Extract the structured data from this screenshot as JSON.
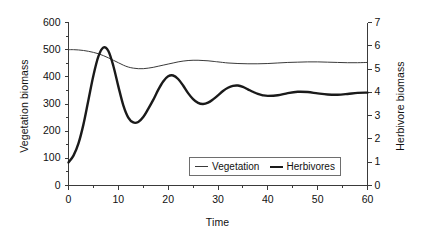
{
  "chart_data": {
    "type": "line",
    "title": "",
    "xlabel": "Time",
    "ylabel": "Vegetation biomass",
    "ylabel_secondary": "Herbivore biomass",
    "xlim": [
      0,
      60
    ],
    "ylim": [
      0,
      600
    ],
    "ylim_secondary": [
      0,
      7
    ],
    "xticks": [
      0,
      10,
      20,
      30,
      40,
      50,
      60
    ],
    "xtick_labels": [
      "0",
      "10",
      "20",
      "30",
      "40",
      "50",
      "60"
    ],
    "yticks": [
      0,
      100,
      200,
      300,
      400,
      500,
      600
    ],
    "ytick_labels": [
      "0",
      "100",
      "200",
      "300",
      "400",
      "500",
      "600"
    ],
    "yticks_secondary": [
      0,
      1,
      2,
      3,
      4,
      5,
      6,
      7
    ],
    "ytick_labels_secondary": [
      "0",
      "1",
      "2",
      "3",
      "4",
      "5",
      "6",
      "7"
    ],
    "grid": false,
    "legend_position": "lower center",
    "series": [
      {
        "name": "Vegetation",
        "axis": "left",
        "color": "#3a3a3a",
        "line_width": 1,
        "x": [
          0,
          1,
          2,
          3,
          4,
          5,
          6,
          7,
          8,
          9,
          10,
          11,
          12,
          13,
          14,
          15,
          16,
          17,
          18,
          19,
          20,
          21,
          22,
          23,
          24,
          25,
          26,
          27,
          28,
          29,
          30,
          32,
          34,
          36,
          38,
          40,
          42,
          44,
          46,
          48,
          50,
          52,
          54,
          56,
          58,
          60
        ],
        "y": [
          500,
          500,
          499,
          497,
          494,
          490,
          485,
          478,
          470,
          461,
          452,
          443,
          436,
          432,
          430,
          430,
          432,
          435,
          439,
          443,
          447,
          451,
          455,
          458,
          460,
          461,
          461,
          460,
          459,
          457,
          455,
          451,
          449,
          448,
          448,
          449,
          451,
          453,
          454,
          455,
          455,
          454,
          453,
          452,
          452,
          453
        ]
      },
      {
        "name": "Herbivores",
        "axis": "right",
        "color": "#1a1a1a",
        "line_width": 2.4,
        "x": [
          0,
          1,
          2,
          3,
          4,
          5,
          6,
          7,
          8,
          9,
          10,
          11,
          12,
          13,
          14,
          15,
          16,
          17,
          18,
          19,
          20,
          21,
          22,
          23,
          24,
          25,
          26,
          27,
          28,
          29,
          30,
          31,
          32,
          33,
          34,
          35,
          36,
          37,
          38,
          39,
          40,
          42,
          44,
          46,
          48,
          50,
          52,
          54,
          56,
          58,
          60
        ],
        "y": [
          85,
          110,
          155,
          225,
          315,
          405,
          475,
          508,
          495,
          440,
          365,
          295,
          250,
          232,
          234,
          252,
          282,
          315,
          352,
          383,
          402,
          405,
          392,
          368,
          340,
          318,
          304,
          300,
          305,
          317,
          332,
          348,
          360,
          367,
          368,
          363,
          354,
          345,
          337,
          332,
          330,
          332,
          340,
          345,
          344,
          339,
          335,
          334,
          337,
          341,
          342
        ],
        "y_secondary_scale": 0.011667
      }
    ]
  },
  "legend": {
    "entries": [
      {
        "label": "Vegetation",
        "style": "thin"
      },
      {
        "label": "Herbivores",
        "style": "thick"
      }
    ]
  }
}
